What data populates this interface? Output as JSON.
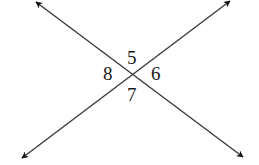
{
  "diagram": {
    "colors": {
      "line": "#3a3a3a",
      "arrow": "#111111",
      "text": "#1a1a1a"
    },
    "intersection": {
      "x": 132,
      "y": 73
    },
    "lines": [
      {
        "id": "line-a",
        "from": {
          "x": 36,
          "y": 2
        },
        "to": {
          "x": 243,
          "y": 157
        }
      },
      {
        "id": "line-b",
        "from": {
          "x": 22,
          "y": 158
        },
        "to": {
          "x": 230,
          "y": 1
        }
      }
    ],
    "angles": [
      {
        "label": "5",
        "position": "top"
      },
      {
        "label": "6",
        "position": "right"
      },
      {
        "label": "7",
        "position": "bottom"
      },
      {
        "label": "8",
        "position": "left"
      }
    ]
  }
}
